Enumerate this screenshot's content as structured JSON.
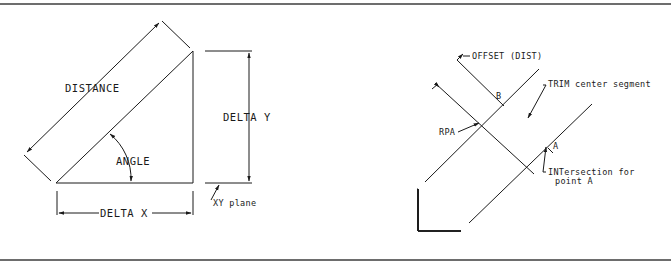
{
  "figure": {
    "left_panel": {
      "title": "Coordinate geometry inquiry",
      "labels": {
        "distance": "DISTANCE",
        "angle": "ANGLE",
        "delta_y": "DELTA Y",
        "delta_x": "DELTA X",
        "xy_plane": "XY plane"
      }
    },
    "right_panel": {
      "labels": {
        "offset": "OFFSET (DIST)",
        "trim": "TRIM center segment",
        "rpa": "RPA",
        "rps": "RPS",
        "intersection_line1": "INTersection for",
        "intersection_line2": "point A",
        "inquiry": "INQUIRY, DIST",
        "point_b_top": "B",
        "point_a_right": "A",
        "point_b_shape": "B",
        "point_a_shape": "A",
        "point_b_box": "B",
        "point_a_box": "A"
      }
    }
  },
  "colors": {
    "ink": "#1a1a1a",
    "rule": "#6d6d6d",
    "background": "#ffffff"
  }
}
